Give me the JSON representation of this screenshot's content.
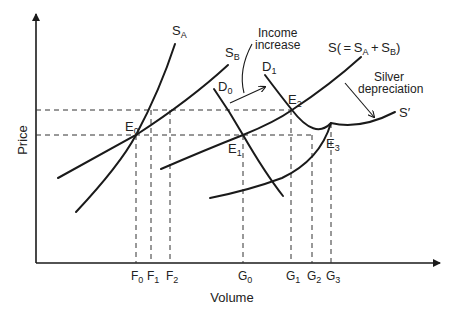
{
  "diagram": {
    "axes": {
      "y_label": "Price",
      "x_label": "Volume"
    },
    "curves": {
      "SA": {
        "main": "S",
        "sub": "A"
      },
      "SB": {
        "main": "S",
        "sub": "B"
      },
      "S": {
        "text": "S( = S",
        "sub1": "A",
        "mid": " + S",
        "sub2": "B",
        "end": ")"
      },
      "S_prime": {
        "text": "S′"
      },
      "D0": {
        "main": "D",
        "sub": "0"
      },
      "D1": {
        "main": "D",
        "sub": "1"
      }
    },
    "equilibria": [
      {
        "main": "E",
        "sub": "0"
      },
      {
        "main": "E",
        "sub": "1"
      },
      {
        "main": "E",
        "sub": "2"
      },
      {
        "main": "E",
        "sub": "3"
      }
    ],
    "x_ticks": [
      {
        "main": "F",
        "sub": "0"
      },
      {
        "main": "F",
        "sub": "1"
      },
      {
        "main": "F",
        "sub": "2"
      },
      {
        "main": "G",
        "sub": "0"
      },
      {
        "main": "G",
        "sub": "1"
      },
      {
        "main": "G",
        "sub": "2"
      },
      {
        "main": "G",
        "sub": "3"
      }
    ],
    "annotations": {
      "income_line1": "Income",
      "income_line2": "increase",
      "silver_line1": "Silver",
      "silver_line2": "depreciation"
    }
  }
}
